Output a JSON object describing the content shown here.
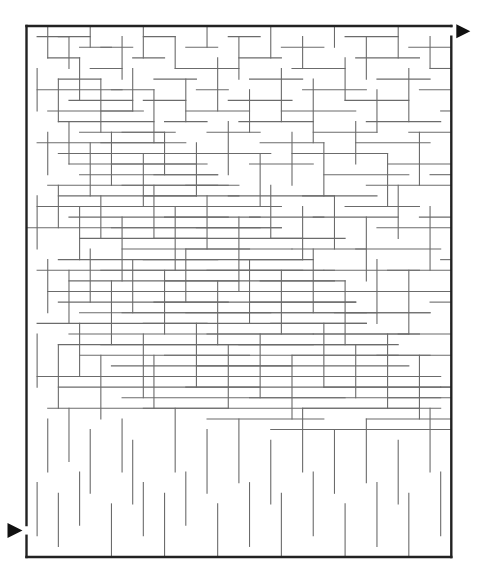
{
  "title": "Maze",
  "maze": {
    "cols": 40,
    "rows": 50,
    "origin": [
      26.5,
      26
    ],
    "cell": 10.62,
    "colors": {
      "wall": "#6b6b6b",
      "frame": "#222222",
      "arrow": "#111111",
      "background": "#ffffff"
    },
    "entrance": {
      "side": "left",
      "row": 47,
      "label": "Start",
      "icon": "triangle-right-icon"
    },
    "exit": {
      "side": "right",
      "row": 0,
      "label": "Finish",
      "icon": "triangle-right-icon"
    },
    "h_walls": [
      [
        1,
        1,
        4
      ],
      [
        3,
        2,
        5
      ],
      [
        6,
        1,
        9
      ],
      [
        8,
        2,
        10
      ],
      [
        11,
        1,
        13
      ],
      [
        12,
        3,
        16
      ],
      [
        15,
        2,
        18
      ],
      [
        17,
        1,
        19
      ],
      [
        19,
        0,
        24
      ],
      [
        23,
        1,
        28
      ],
      [
        25,
        2,
        29
      ],
      [
        28,
        1,
        32
      ],
      [
        30,
        3,
        35
      ],
      [
        33,
        1,
        36
      ],
      [
        36,
        2,
        39
      ],
      [
        1,
        3,
        6
      ],
      [
        2,
        5,
        8
      ],
      [
        5,
        3,
        7
      ],
      [
        7,
        4,
        10
      ],
      [
        9,
        3,
        12
      ],
      [
        10,
        5,
        14
      ],
      [
        13,
        4,
        17
      ],
      [
        14,
        5,
        18
      ],
      [
        16,
        3,
        20
      ],
      [
        18,
        4,
        22
      ],
      [
        20,
        5,
        26
      ],
      [
        22,
        3,
        27
      ],
      [
        24,
        4,
        30
      ],
      [
        26,
        3,
        31
      ],
      [
        27,
        5,
        33
      ],
      [
        29,
        4,
        37
      ],
      [
        31,
        5,
        38
      ],
      [
        34,
        3,
        40
      ],
      [
        2,
        7,
        10
      ],
      [
        4,
        6,
        9
      ],
      [
        6,
        8,
        12
      ],
      [
        8,
        7,
        11
      ],
      [
        10,
        9,
        13
      ],
      [
        11,
        7,
        15
      ],
      [
        13,
        8,
        16
      ],
      [
        15,
        9,
        19
      ],
      [
        17,
        7,
        21
      ],
      [
        19,
        8,
        24
      ],
      [
        21,
        9,
        25
      ],
      [
        23,
        7,
        29
      ],
      [
        25,
        8,
        30
      ],
      [
        27,
        9,
        32
      ],
      [
        30,
        7,
        34
      ],
      [
        32,
        8,
        36
      ],
      [
        35,
        9,
        39
      ],
      [
        1,
        11,
        14
      ],
      [
        3,
        10,
        13
      ],
      [
        5,
        12,
        16
      ],
      [
        7,
        11,
        15
      ],
      [
        9,
        13,
        17
      ],
      [
        12,
        11,
        14
      ],
      [
        14,
        12,
        18
      ],
      [
        16,
        11,
        16
      ],
      [
        18,
        13,
        19
      ],
      [
        20,
        12,
        17
      ],
      [
        22,
        11,
        18
      ],
      [
        24,
        13,
        20
      ],
      [
        26,
        12,
        19
      ],
      [
        28,
        11,
        17
      ],
      [
        31,
        13,
        21
      ],
      [
        33,
        12,
        18
      ],
      [
        36,
        11,
        19
      ],
      [
        2,
        15,
        18
      ],
      [
        4,
        14,
        20
      ],
      [
        6,
        16,
        19
      ],
      [
        8,
        15,
        21
      ],
      [
        10,
        17,
        22
      ],
      [
        12,
        16,
        23
      ],
      [
        15,
        15,
        20
      ],
      [
        17,
        17,
        24
      ],
      [
        19,
        16,
        22
      ],
      [
        21,
        15,
        21
      ],
      [
        23,
        17,
        26
      ],
      [
        25,
        16,
        24
      ],
      [
        27,
        15,
        23
      ],
      [
        29,
        17,
        27
      ],
      [
        32,
        16,
        25
      ],
      [
        34,
        15,
        22
      ],
      [
        37,
        17,
        28
      ],
      [
        1,
        19,
        22
      ],
      [
        3,
        20,
        24
      ],
      [
        5,
        21,
        26
      ],
      [
        7,
        19,
        25
      ],
      [
        9,
        20,
        27
      ],
      [
        11,
        22,
        28
      ],
      [
        13,
        21,
        27
      ],
      [
        16,
        19,
        29
      ],
      [
        18,
        21,
        28
      ],
      [
        20,
        23,
        30
      ],
      [
        22,
        20,
        26
      ],
      [
        24,
        22,
        29
      ],
      [
        26,
        21,
        31
      ],
      [
        28,
        23,
        32
      ],
      [
        30,
        20,
        27
      ],
      [
        33,
        22,
        33
      ],
      [
        35,
        21,
        30
      ],
      [
        38,
        23,
        35
      ],
      [
        2,
        24,
        28
      ],
      [
        4,
        25,
        30
      ],
      [
        6,
        26,
        32
      ],
      [
        8,
        24,
        31
      ],
      [
        10,
        27,
        33
      ],
      [
        12,
        25,
        34
      ],
      [
        14,
        28,
        36
      ],
      [
        16,
        26,
        33
      ],
      [
        18,
        27,
        35
      ],
      [
        21,
        25,
        32
      ],
      [
        23,
        28,
        37
      ],
      [
        25,
        26,
        34
      ],
      [
        27,
        29,
        38
      ],
      [
        29,
        27,
        36
      ],
      [
        31,
        25,
        35
      ],
      [
        34,
        28,
        39
      ],
      [
        36,
        26,
        37
      ],
      [
        38,
        29,
        40
      ],
      [
        1,
        30,
        35
      ],
      [
        3,
        31,
        37
      ],
      [
        5,
        33,
        38
      ],
      [
        7,
        30,
        36
      ],
      [
        9,
        32,
        39
      ],
      [
        11,
        31,
        38
      ],
      [
        13,
        34,
        40
      ],
      [
        15,
        32,
        41
      ],
      [
        17,
        30,
        37
      ],
      [
        19,
        33,
        42
      ],
      [
        21,
        31,
        39
      ],
      [
        23,
        34,
        43
      ],
      [
        25,
        32,
        40
      ],
      [
        27,
        30,
        38
      ],
      [
        29,
        35,
        44
      ],
      [
        31,
        33,
        41
      ],
      [
        33,
        31,
        39
      ],
      [
        35,
        34,
        43
      ],
      [
        37,
        32,
        40
      ],
      [
        2,
        36,
        40
      ],
      [
        4,
        38,
        42
      ],
      [
        6,
        37,
        43
      ],
      [
        8,
        39,
        44
      ],
      [
        10,
        36,
        42
      ],
      [
        12,
        40,
        45
      ],
      [
        14,
        38,
        44
      ],
      [
        16,
        41,
        46
      ],
      [
        18,
        37,
        43
      ],
      [
        20,
        40,
        47
      ],
      [
        22,
        39,
        45
      ],
      [
        24,
        42,
        48
      ],
      [
        26,
        38,
        44
      ],
      [
        28,
        41,
        47
      ],
      [
        30,
        40,
        46
      ],
      [
        32,
        43,
        49
      ],
      [
        34,
        39,
        45
      ],
      [
        36,
        42,
        48
      ],
      [
        38,
        40,
        47
      ],
      [
        1,
        45,
        49
      ],
      [
        3,
        44,
        48
      ],
      [
        5,
        46,
        49
      ],
      [
        7,
        43,
        47
      ],
      [
        9,
        47,
        49
      ],
      [
        11,
        44,
        48
      ],
      [
        13,
        46,
        49
      ],
      [
        15,
        45,
        49
      ],
      [
        17,
        47,
        49
      ],
      [
        19,
        44,
        48
      ],
      [
        21,
        46,
        49
      ],
      [
        23,
        45,
        49
      ],
      [
        25,
        47,
        49
      ],
      [
        27,
        44,
        48
      ],
      [
        29,
        46,
        49
      ],
      [
        31,
        45,
        49
      ],
      [
        33,
        47,
        49
      ],
      [
        35,
        44,
        48
      ],
      [
        37,
        46,
        49
      ]
    ],
    "v_walls": [
      [
        2,
        0,
        3
      ],
      [
        4,
        1,
        4
      ],
      [
        6,
        0,
        2
      ],
      [
        9,
        1,
        5
      ],
      [
        11,
        0,
        3
      ],
      [
        14,
        1,
        4
      ],
      [
        17,
        0,
        2
      ],
      [
        20,
        1,
        5
      ],
      [
        23,
        0,
        3
      ],
      [
        26,
        1,
        4
      ],
      [
        29,
        0,
        2
      ],
      [
        32,
        1,
        5
      ],
      [
        35,
        0,
        3
      ],
      [
        38,
        1,
        4
      ],
      [
        1,
        4,
        8
      ],
      [
        3,
        5,
        9
      ],
      [
        5,
        3,
        7
      ],
      [
        7,
        5,
        10
      ],
      [
        10,
        4,
        8
      ],
      [
        12,
        6,
        11
      ],
      [
        15,
        5,
        9
      ],
      [
        18,
        3,
        8
      ],
      [
        21,
        6,
        10
      ],
      [
        24,
        4,
        9
      ],
      [
        27,
        5,
        11
      ],
      [
        30,
        3,
        7
      ],
      [
        33,
        6,
        10
      ],
      [
        36,
        4,
        9
      ],
      [
        2,
        10,
        14
      ],
      [
        4,
        9,
        13
      ],
      [
        6,
        11,
        16
      ],
      [
        8,
        10,
        15
      ],
      [
        11,
        12,
        17
      ],
      [
        13,
        10,
        14
      ],
      [
        16,
        11,
        16
      ],
      [
        19,
        9,
        14
      ],
      [
        22,
        12,
        17
      ],
      [
        25,
        10,
        15
      ],
      [
        28,
        11,
        16
      ],
      [
        31,
        9,
        13
      ],
      [
        34,
        12,
        17
      ],
      [
        37,
        10,
        15
      ],
      [
        1,
        16,
        21
      ],
      [
        3,
        15,
        19
      ],
      [
        5,
        17,
        22
      ],
      [
        7,
        16,
        20
      ],
      [
        9,
        18,
        24
      ],
      [
        12,
        15,
        20
      ],
      [
        14,
        17,
        23
      ],
      [
        17,
        16,
        21
      ],
      [
        20,
        18,
        25
      ],
      [
        23,
        15,
        20
      ],
      [
        26,
        17,
        22
      ],
      [
        29,
        16,
        21
      ],
      [
        32,
        18,
        24
      ],
      [
        35,
        15,
        20
      ],
      [
        38,
        17,
        23
      ],
      [
        2,
        22,
        27
      ],
      [
        4,
        23,
        28
      ],
      [
        6,
        21,
        26
      ],
      [
        8,
        24,
        30
      ],
      [
        10,
        22,
        27
      ],
      [
        13,
        23,
        29
      ],
      [
        15,
        21,
        26
      ],
      [
        18,
        24,
        30
      ],
      [
        21,
        22,
        28
      ],
      [
        24,
        23,
        29
      ],
      [
        27,
        21,
        27
      ],
      [
        30,
        24,
        30
      ],
      [
        33,
        22,
        28
      ],
      [
        36,
        23,
        29
      ],
      [
        1,
        29,
        34
      ],
      [
        3,
        30,
        36
      ],
      [
        5,
        28,
        33
      ],
      [
        7,
        31,
        37
      ],
      [
        11,
        29,
        35
      ],
      [
        12,
        31,
        36
      ],
      [
        16,
        28,
        34
      ],
      [
        19,
        30,
        36
      ],
      [
        22,
        29,
        35
      ],
      [
        25,
        31,
        37
      ],
      [
        28,
        28,
        34
      ],
      [
        31,
        30,
        35
      ],
      [
        34,
        29,
        36
      ],
      [
        37,
        31,
        37
      ],
      [
        2,
        37,
        42
      ],
      [
        4,
        36,
        41
      ],
      [
        6,
        38,
        44
      ],
      [
        9,
        37,
        42
      ],
      [
        10,
        39,
        45
      ],
      [
        14,
        36,
        42
      ],
      [
        17,
        38,
        44
      ],
      [
        20,
        37,
        43
      ],
      [
        23,
        39,
        45
      ],
      [
        26,
        36,
        42
      ],
      [
        29,
        38,
        44
      ],
      [
        32,
        37,
        43
      ],
      [
        35,
        39,
        45
      ],
      [
        38,
        36,
        42
      ],
      [
        1,
        43,
        48
      ],
      [
        3,
        44,
        49
      ],
      [
        5,
        42,
        47
      ],
      [
        8,
        45,
        50
      ],
      [
        11,
        43,
        48
      ],
      [
        13,
        44,
        50
      ],
      [
        15,
        42,
        47
      ],
      [
        18,
        45,
        50
      ],
      [
        21,
        43,
        49
      ],
      [
        24,
        44,
        50
      ],
      [
        27,
        42,
        48
      ],
      [
        30,
        45,
        50
      ],
      [
        33,
        43,
        49
      ],
      [
        36,
        44,
        50
      ],
      [
        39,
        42,
        48
      ]
    ]
  }
}
